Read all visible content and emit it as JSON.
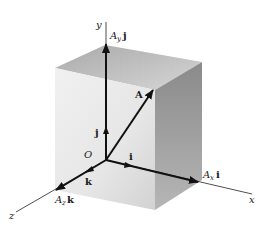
{
  "figure": {
    "type": "3D vector component decomposition",
    "origin_label": "O",
    "axes": {
      "x": {
        "label": "x"
      },
      "y": {
        "label": "y"
      },
      "z": {
        "label": "z"
      }
    },
    "unit_vectors": {
      "i": {
        "label": "i"
      },
      "j": {
        "label": "j"
      },
      "k": {
        "label": "k"
      }
    },
    "vector": {
      "label": "A"
    },
    "components": {
      "x": {
        "coef": "A",
        "sub": "x",
        "unit": "i"
      },
      "y": {
        "coef": "A",
        "sub": "y",
        "unit": "j"
      },
      "z": {
        "coef": "A",
        "sub": "z",
        "unit": "k"
      }
    },
    "colors": {
      "line": "#111111",
      "box_top": "#b9b9b9",
      "box_front": "#e8e8e8",
      "box_right": "#9a9a9a",
      "background": "#ffffff"
    }
  }
}
